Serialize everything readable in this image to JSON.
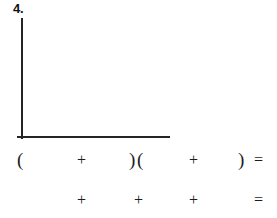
{
  "page": {
    "kind": "worksheet-problem",
    "background_color": "#ffffff",
    "ink_color": "#252525",
    "problem_number": "4."
  },
  "graph": {
    "name": "empty-coordinate-axes",
    "has_data": false,
    "has_gridlines": false,
    "has_tick_labels": false,
    "vertical_axis": {
      "x": 22,
      "y_top": 18,
      "y_bottom": 139
    },
    "horizontal_axis": {
      "y": 137,
      "x_left": 17,
      "x_right": 170
    }
  },
  "expression_rows": [
    {
      "name": "expression-row-1",
      "symbols": [
        {
          "name": "open-paren-1",
          "glyph": "(",
          "x": 17,
          "type": "paren"
        },
        {
          "name": "plus-1",
          "glyph": "+",
          "x": 77,
          "type": "operator"
        },
        {
          "name": "close-paren-1",
          "glyph": ")",
          "x": 129,
          "type": "paren"
        },
        {
          "name": "open-paren-2",
          "glyph": "(",
          "x": 137,
          "type": "paren"
        },
        {
          "name": "plus-2",
          "glyph": "+",
          "x": 189,
          "type": "operator"
        },
        {
          "name": "close-paren-2",
          "glyph": ")",
          "x": 238,
          "type": "paren"
        },
        {
          "name": "equals-1",
          "glyph": "=",
          "x": 254,
          "type": "operator"
        }
      ]
    },
    {
      "name": "expression-row-2",
      "symbols": [
        {
          "name": "plus-3",
          "glyph": "+",
          "x": 77,
          "type": "operator"
        },
        {
          "name": "plus-4",
          "glyph": "+",
          "x": 134,
          "type": "operator"
        },
        {
          "name": "plus-5",
          "glyph": "+",
          "x": 189,
          "type": "operator"
        },
        {
          "name": "equals-2",
          "glyph": "=",
          "x": 254,
          "type": "operator"
        }
      ]
    }
  ]
}
